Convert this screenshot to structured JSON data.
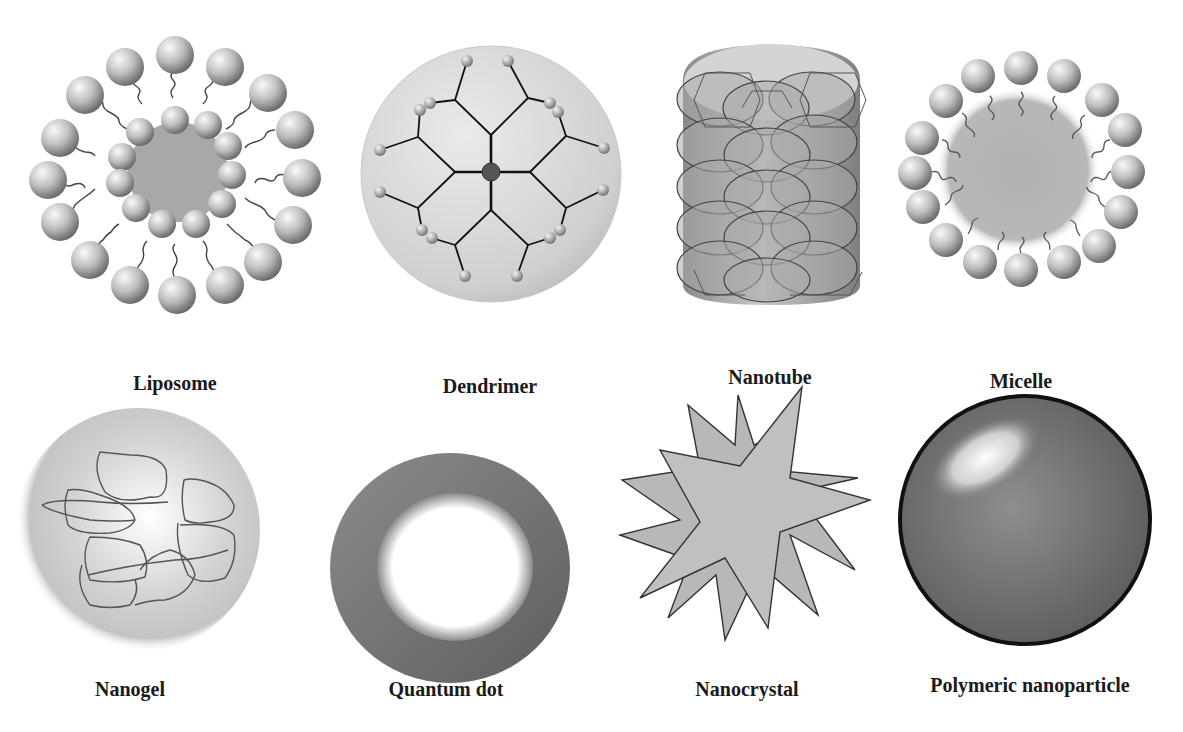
{
  "figure": {
    "panels": [
      {
        "id": "liposome",
        "label": "Liposome",
        "center": [
          175,
          180
        ],
        "label_pos": [
          175,
          385
        ]
      },
      {
        "id": "dendrimer",
        "label": "Dendrimer",
        "center": [
          490,
          172
        ],
        "label_pos": [
          490,
          388
        ]
      },
      {
        "id": "nanotube",
        "label": "Nanotube",
        "center": [
          770,
          165
        ],
        "label_pos": [
          770,
          380
        ]
      },
      {
        "id": "micelle",
        "label": "Micelle",
        "center": [
          1020,
          175
        ],
        "label_pos": [
          1020,
          384
        ]
      },
      {
        "id": "nanogel",
        "label": "Nanogel",
        "center": [
          135,
          565
        ],
        "label_pos": [
          130,
          690
        ]
      },
      {
        "id": "quantum-dot",
        "label": "Quantum dot",
        "center": [
          450,
          565
        ],
        "label_pos": [
          446,
          690
        ]
      },
      {
        "id": "nanocrystal",
        "label": "Nanocrystal",
        "center": [
          745,
          555
        ],
        "label_pos": [
          747,
          690
        ]
      },
      {
        "id": "polymeric-nanoparticle",
        "label": "Polymeric nanoparticle",
        "center": [
          1020,
          560
        ],
        "label_pos": [
          1030,
          686
        ]
      }
    ]
  },
  "colors": {
    "background": "#ffffff",
    "sphere_light": "#f2f2f2",
    "sphere_dark": "#7a7a7a",
    "core_gray": "#a5a5a5",
    "outline": "#333333",
    "label": "#1a1a1a"
  }
}
